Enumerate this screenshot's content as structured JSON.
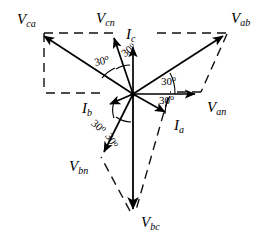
{
  "figure": {
    "type": "phasor-diagram",
    "origin": {
      "x": 133,
      "y": 94
    },
    "background_color": "#ffffff",
    "stroke_color": "#000000"
  },
  "phasors": [
    {
      "id": "van",
      "label_main": "V",
      "label_sub": "an",
      "angle_deg": 0,
      "length": 67,
      "style": "solid",
      "kind": "phase-voltage",
      "label_x": 207,
      "label_y": 99
    },
    {
      "id": "vbn",
      "label_main": "V",
      "label_sub": "bn",
      "angle_deg": -120,
      "length": 72,
      "style": "solid",
      "kind": "phase-voltage",
      "label_x": 69,
      "label_y": 158
    },
    {
      "id": "vcn",
      "label_main": "V",
      "label_sub": "cn",
      "angle_deg": 120,
      "length": 64,
      "style": "solid",
      "kind": "phase-voltage",
      "label_x": 96,
      "label_y": 10
    },
    {
      "id": "vab",
      "label_main": "V",
      "label_sub": "ab",
      "angle_deg": 30,
      "length": 113,
      "style": "solid",
      "kind": "line-voltage",
      "label_x": 231,
      "label_y": 10
    },
    {
      "id": "vbc",
      "label_main": "V",
      "label_sub": "bc",
      "angle_deg": -90,
      "length": 122,
      "style": "solid",
      "kind": "line-voltage",
      "label_x": 141,
      "label_y": 214
    },
    {
      "id": "vca",
      "label_main": "V",
      "label_sub": "ca",
      "angle_deg": 150,
      "length": 113,
      "style": "solid",
      "kind": "line-voltage",
      "label_x": 17,
      "label_y": 11
    },
    {
      "id": "ia",
      "label_main": "I",
      "label_sub": "a",
      "angle_deg": -30,
      "length": 42,
      "style": "solid",
      "kind": "line-current",
      "label_x": 174,
      "label_y": 117
    },
    {
      "id": "ib",
      "label_main": "I",
      "label_sub": "b",
      "angle_deg": 200,
      "length": 26,
      "style": "solid",
      "kind": "line-current",
      "label_x": 82,
      "label_y": 100
    },
    {
      "id": "ic",
      "label_main": "I",
      "label_sub": "c",
      "angle_deg": 90,
      "length": 52,
      "style": "solid",
      "kind": "line-current",
      "label_x": 126,
      "label_y": 26
    }
  ],
  "angle_marks": [
    {
      "id": "angle-vca-vcn",
      "text": "30",
      "degree_symbol": "o",
      "x": 93,
      "y": 57,
      "rotation_class": "rot-n12"
    },
    {
      "id": "angle-vcn-ic",
      "text": "30",
      "degree_symbol": "o",
      "x": 119,
      "y": 50,
      "rotation_class": "rot-n35"
    },
    {
      "id": "angle-van-vab",
      "text": "30",
      "degree_symbol": "o",
      "x": 161,
      "y": 75,
      "rotation_class": ""
    },
    {
      "id": "angle-van-ia",
      "text": "30",
      "degree_symbol": "o",
      "x": 159,
      "y": 93,
      "rotation_class": ""
    },
    {
      "id": "angle-ib-vbn",
      "text": "30",
      "degree_symbol": "o",
      "x": 97,
      "y": 117,
      "rotation_class": "rot-p40"
    },
    {
      "id": "angle-vbn-vbc",
      "text": "30",
      "degree_symbol": "o",
      "x": 113,
      "y": 131,
      "rotation_class": "rot-p62"
    }
  ],
  "construction_lines": {
    "style": "dashed",
    "description": "Dashed parallelogram construction showing line voltages as vector sums of phase voltages",
    "segments": [
      {
        "id": "dash-vca-to-vcn-top",
        "x1": 44,
        "y1": 33,
        "x2": 114,
        "y2": 33
      },
      {
        "id": "dash-vcn-to-vab-top",
        "x1": 156,
        "y1": 33,
        "x2": 226,
        "y2": 33
      },
      {
        "id": "dash-vab-down-right",
        "x1": 226,
        "y1": 33,
        "x2": 200,
        "y2": 93
      },
      {
        "id": "dash-van-left",
        "x1": 200,
        "y1": 93,
        "x2": 168,
        "y2": 93
      },
      {
        "id": "dash-van-to-vbc",
        "x1": 168,
        "y1": 96,
        "x2": 135,
        "y2": 212
      },
      {
        "id": "dash-vbc-to-vbn",
        "x1": 131,
        "y1": 212,
        "x2": 101,
        "y2": 158
      },
      {
        "id": "dash-vbn-left-horiz",
        "x1": 101,
        "y1": 93,
        "x2": 44,
        "y2": 93
      },
      {
        "id": "dash-vca-down",
        "x1": 44,
        "y1": 33,
        "x2": 44,
        "y2": 93
      }
    ]
  }
}
